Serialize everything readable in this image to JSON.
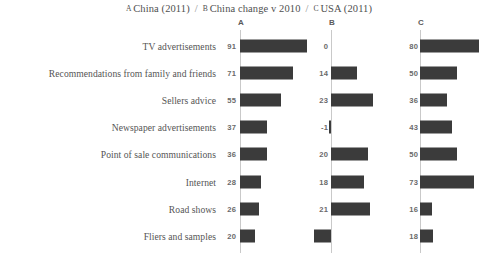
{
  "title": {
    "segments": [
      {
        "key": "A",
        "text": "China (2011)"
      },
      {
        "key": "B",
        "text": "China change v 2010"
      },
      {
        "key": "C",
        "text": "USA (2011)"
      }
    ],
    "separator": "/"
  },
  "columns": {
    "a_header": "A",
    "b_header": "B",
    "c_header": "C"
  },
  "colors": {
    "bar": "#3b3b3b",
    "axis": "#c9c9c9",
    "text": "#555555",
    "value_text": "#6a6a6a",
    "background": "#ffffff"
  },
  "chart_data": {
    "type": "bar",
    "xlabel": "",
    "ylabel": "",
    "grid": false,
    "legend": "none",
    "orientation": "horizontal",
    "categories": [
      "TV advertisements",
      "Recommendations from family and friends",
      "Sellers advice",
      "Newspaper advertisements",
      "Point of sale communications",
      "Internet",
      "Road shows",
      "Fliers and samples"
    ],
    "series": [
      {
        "name": "A",
        "label": "China (2011)",
        "values": [
          91,
          71,
          55,
          37,
          36,
          28,
          26,
          20
        ],
        "xlim": [
          0,
          100
        ]
      },
      {
        "name": "B",
        "label": "China change v 2010",
        "values": [
          0,
          14,
          23,
          -1,
          20,
          18,
          21,
          -9
        ],
        "xlim": [
          -25,
          30
        ]
      },
      {
        "name": "C",
        "label": "USA (2011)",
        "values": [
          80,
          50,
          36,
          43,
          50,
          73,
          16,
          18
        ],
        "xlim": [
          0,
          100
        ]
      }
    ]
  }
}
